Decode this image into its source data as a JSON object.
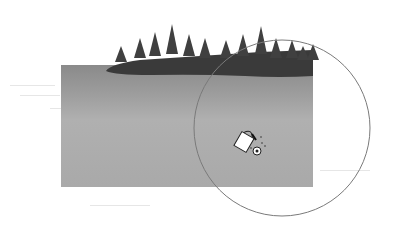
{
  "scene": {
    "description": "Grayscale landscape: lake with forested island, paint bucket fill tool cursor with circular brush outline",
    "water_color_top": "#8a8a8a",
    "water_color_bottom": "#a9a9a9",
    "island_color": "#3a3a3a",
    "tree_color": "#404040",
    "circle_stroke": "#7a7a7a"
  },
  "cursor": {
    "tool": "paint-bucket-icon",
    "target": "target-icon"
  }
}
